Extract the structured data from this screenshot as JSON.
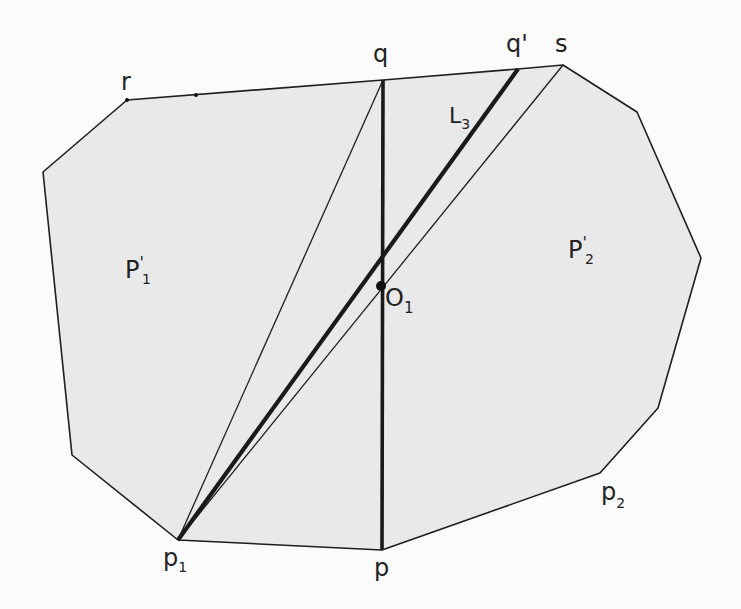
{
  "diagram": {
    "type": "geometry",
    "colors": {
      "background": "#fbfbfb",
      "polygon_fill": "#e9e9e9",
      "stroke": "#1e1e1e"
    },
    "polygon_vertices": [
      [
        127,
        100
      ],
      [
        383,
        80
      ],
      [
        518,
        69
      ],
      [
        563,
        65
      ],
      [
        637,
        112
      ],
      [
        701,
        258
      ],
      [
        658,
        408
      ],
      [
        600,
        473
      ],
      [
        382,
        550
      ],
      [
        178,
        540
      ],
      [
        72,
        455
      ],
      [
        43,
        172
      ]
    ],
    "segments": [
      {
        "name": "q-p",
        "from": [
          383,
          80
        ],
        "to": [
          382,
          550
        ],
        "weight": "bold"
      },
      {
        "name": "L3",
        "from": [
          178,
          540
        ],
        "to": [
          518,
          69
        ],
        "weight": "bold"
      },
      {
        "name": "p1-q",
        "from": [
          178,
          540
        ],
        "to": [
          383,
          80
        ],
        "weight": "thin"
      },
      {
        "name": "p1-s",
        "from": [
          178,
          540
        ],
        "to": [
          563,
          65
        ],
        "weight": "thin"
      }
    ],
    "points": {
      "O1": [
        381,
        286
      ]
    },
    "labels": {
      "q": "q",
      "q_prime": "q'",
      "s": "s",
      "r": "r",
      "L3_main": "L",
      "L3_sub": "3",
      "O1_main": "O",
      "O1_sub": "1",
      "P1_main": "P",
      "P1_prime": "'",
      "P1_sub": "1",
      "P2_main": "P",
      "P2_prime": "'",
      "P2_sub": "2",
      "p": "p",
      "p1_main": "p",
      "p1_sub": "1",
      "p2_main": "p",
      "p2_sub": "2"
    }
  }
}
